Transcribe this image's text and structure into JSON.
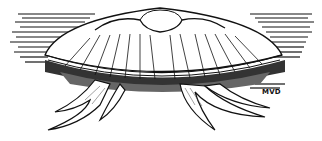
{
  "illustration": {
    "subject": "jellyfish line drawing",
    "signature": "MVD",
    "ink_color": "#111111",
    "paper_color": "#ffffff"
  }
}
